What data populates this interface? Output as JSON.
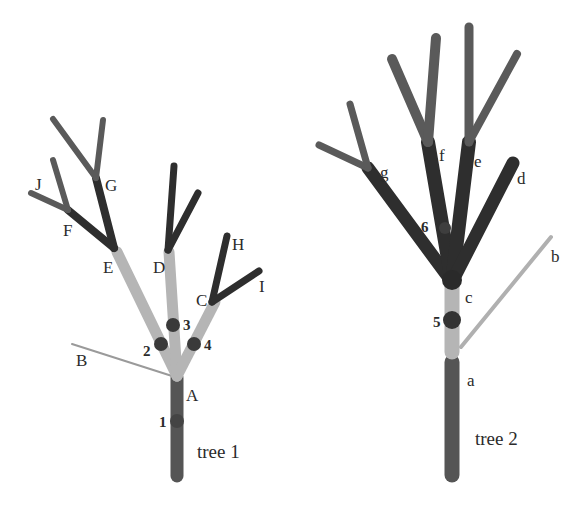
{
  "colors": {
    "background": "#ffffff",
    "trunk": "#555555",
    "light_branch": "#b5b5b5",
    "dark_branch": "#2e2e2e",
    "medium_branch": "#5a5a5a",
    "dot": "#3a3a3a",
    "text": "#2b2b2b"
  },
  "tree1": {
    "caption": "tree 1",
    "labels": {
      "A": "A",
      "B": "B",
      "C": "C",
      "D": "D",
      "E": "E",
      "F": "F",
      "G": "G",
      "H": "H",
      "I": "I",
      "J": "J"
    },
    "markers": [
      "1",
      "2",
      "3",
      "4"
    ]
  },
  "tree2": {
    "caption": "tree 2",
    "labels": {
      "a": "a",
      "b": "b",
      "c": "c",
      "d": "d",
      "e": "e",
      "f": "f",
      "g": "g"
    },
    "markers": [
      "5",
      "6"
    ]
  }
}
